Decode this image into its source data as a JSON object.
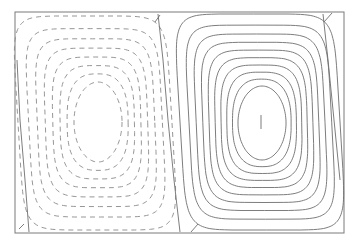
{
  "chart_data": {
    "type": "contour",
    "title": "",
    "xlabel": "",
    "ylabel": "",
    "grid": false,
    "legend": null,
    "frame": {
      "x0": 15,
      "y0": 12,
      "x1": 344,
      "y1": 233
    },
    "cells": [
      {
        "name": "left-cell",
        "sign": "negative",
        "line_style": "dashed",
        "levels": 8,
        "outer": {
          "x0": 18,
          "y0": 16,
          "x1": 172,
          "y1": 230
        },
        "inner": {
          "cx": 98,
          "cy": 122,
          "rx": 24,
          "ry": 40
        },
        "center_marker": false
      },
      {
        "name": "right-cell",
        "sign": "positive",
        "line_style": "solid",
        "levels": 10,
        "outer": {
          "x0": 180,
          "y0": 14,
          "x1": 340,
          "y1": 230
        },
        "inner": {
          "cx": 262,
          "cy": 123,
          "rx": 24,
          "ry": 37
        },
        "center_marker": true,
        "center_marker_pos": {
          "x": 261,
          "y1": 115,
          "y2": 129
        }
      }
    ],
    "zero_contours": [
      {
        "name": "separatrix-middle",
        "points": [
          [
            158,
            14
          ],
          [
            163,
            60
          ],
          [
            168,
            120
          ],
          [
            174,
            180
          ],
          [
            180,
            232
          ]
        ]
      },
      {
        "name": "separatrix-left-edge",
        "points": [
          [
            17,
            60
          ],
          [
            20,
            120
          ],
          [
            25,
            180
          ],
          [
            29,
            232
          ]
        ]
      },
      {
        "name": "separatrix-right-edge",
        "points": [
          [
            323,
            14
          ],
          [
            328,
            60
          ],
          [
            334,
            120
          ],
          [
            340,
            180
          ]
        ]
      }
    ],
    "corner_ticks": [
      {
        "x1": 155,
        "y1": 22,
        "x2": 160,
        "y2": 15
      },
      {
        "x1": 324,
        "y1": 22,
        "x2": 332,
        "y2": 13
      },
      {
        "x1": 19,
        "y1": 229,
        "x2": 24,
        "y2": 224
      },
      {
        "x1": 191,
        "y1": 232,
        "x2": 198,
        "y2": 224
      }
    ]
  }
}
